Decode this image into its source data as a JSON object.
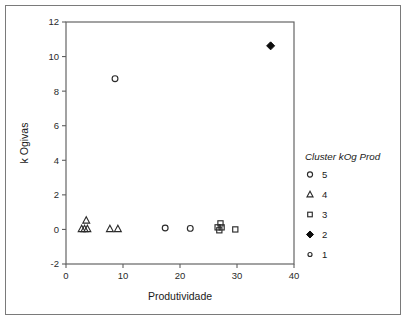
{
  "figure": {
    "background_color": "#ffffff",
    "frame_color": "#7a7a7a",
    "axis_color": "#5f5f5f",
    "marker_color": "#2b2b2b"
  },
  "chart_data": {
    "type": "scatter",
    "title": "",
    "xlabel": "Produtividade",
    "ylabel": "k Ogivas",
    "xlim": [
      0,
      40
    ],
    "ylim": [
      -2,
      12
    ],
    "xticks": [
      0,
      10,
      20,
      30,
      40
    ],
    "yticks": [
      -2,
      0,
      2,
      4,
      6,
      8,
      10,
      12
    ],
    "xtick_labels": [
      "0",
      "10",
      "20",
      "30",
      "40"
    ],
    "ytick_labels": [
      "-2",
      "0",
      "2",
      "4",
      "6",
      "8",
      "10",
      "12"
    ],
    "grid": false,
    "legend_position": "right",
    "legend_title": "Cluster kOg Prod",
    "series": [
      {
        "name": "5",
        "marker": "circle-open",
        "points": [
          {
            "x": 8.6,
            "y": 8.72
          },
          {
            "x": 17.4,
            "y": 0.08
          },
          {
            "x": 21.8,
            "y": 0.06
          }
        ]
      },
      {
        "name": "4",
        "marker": "triangle-open",
        "points": [
          {
            "x": 3.55,
            "y": 0.52
          },
          {
            "x": 2.75,
            "y": 0.03
          },
          {
            "x": 3.25,
            "y": 0.03
          },
          {
            "x": 3.75,
            "y": 0.03
          },
          {
            "x": 7.7,
            "y": 0.03
          },
          {
            "x": 9.1,
            "y": 0.03
          }
        ]
      },
      {
        "name": "3",
        "marker": "square-open",
        "points": [
          {
            "x": 27.1,
            "y": 0.35
          },
          {
            "x": 26.6,
            "y": 0.12
          },
          {
            "x": 27.3,
            "y": 0.12
          },
          {
            "x": 26.9,
            "y": -0.05
          },
          {
            "x": 29.7,
            "y": 0.0
          }
        ]
      },
      {
        "name": "2",
        "marker": "diamond-filled",
        "points": [
          {
            "x": 35.9,
            "y": 10.62
          }
        ]
      },
      {
        "name": "1",
        "marker": "circle-open-small",
        "points": []
      }
    ]
  },
  "legend": {
    "title": "Cluster kOg Prod",
    "entries": [
      {
        "label": "5",
        "marker": "circle-open"
      },
      {
        "label": "4",
        "marker": "triangle-open"
      },
      {
        "label": "3",
        "marker": "square-open"
      },
      {
        "label": "2",
        "marker": "diamond-filled"
      },
      {
        "label": "1",
        "marker": "circle-open-small"
      }
    ]
  }
}
